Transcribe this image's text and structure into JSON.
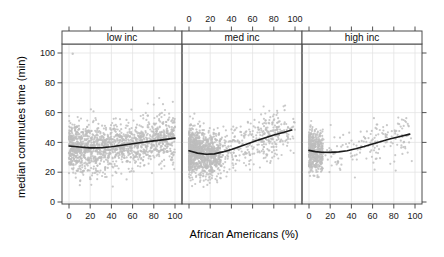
{
  "figure": {
    "width": 444,
    "height": 257,
    "background": "#ffffff"
  },
  "colors": {
    "point": "#bdbdbd",
    "smooth_line": "#1c1c1c",
    "grid": "#e3e3e3",
    "panel_border": "#4d4d4d",
    "strip_bg": "#ffffff",
    "tick": "#404040",
    "text": "#000000"
  },
  "axes": {
    "x_label": "African Americans (%)",
    "y_label": "median commutes time (min)",
    "x_ticks": [
      0,
      20,
      40,
      60,
      80,
      100
    ],
    "x_tick_labels": [
      "0",
      "20",
      "40",
      "60",
      "80",
      "100"
    ],
    "y_ticks": [
      0,
      20,
      40,
      60,
      80,
      100
    ],
    "y_tick_labels": [
      "0",
      "20",
      "40",
      "60",
      "80",
      "100"
    ],
    "xlim": [
      -6.6,
      106.6
    ],
    "ylim": [
      -1.3,
      107.4
    ],
    "top_labels_panel_index": 1,
    "bottom_labels_panel_indices": [
      0,
      2
    ],
    "grid": true
  },
  "chart_data": {
    "type": "scatter",
    "title": "",
    "xlabel": "African Americans (%)",
    "ylabel": "median commutes time (min)",
    "layout": {
      "rows": 1,
      "cols": 3
    },
    "panels": [
      {
        "label": "low inc",
        "smooth": [
          [
            0,
            37.6
          ],
          [
            10,
            36.9
          ],
          [
            20,
            36.3
          ],
          [
            30,
            36.4
          ],
          [
            40,
            37.1
          ],
          [
            50,
            38.1
          ],
          [
            60,
            39.1
          ],
          [
            70,
            40.1
          ],
          [
            80,
            41.0
          ],
          [
            90,
            41.9
          ],
          [
            100,
            42.9
          ]
        ],
        "points_model": {
          "seed": 11,
          "n": 1450,
          "y_sd": 8.2,
          "y_clip": [
            4,
            77
          ],
          "clusters": [
            {
              "w": 1.0,
              "x_min": 0,
              "x_max": 100,
              "x_pow": 1.3
            }
          ],
          "outliers": [
            [
              3.5,
              99.5
            ]
          ]
        }
      },
      {
        "label": "med inc",
        "smooth": [
          [
            0,
            34.4
          ],
          [
            8,
            32.8
          ],
          [
            16,
            32.0
          ],
          [
            24,
            32.3
          ],
          [
            32,
            33.6
          ],
          [
            40,
            35.3
          ],
          [
            48,
            37.2
          ],
          [
            56,
            39.2
          ],
          [
            64,
            41.2
          ],
          [
            72,
            43.1
          ],
          [
            80,
            44.9
          ],
          [
            88,
            46.5
          ],
          [
            97,
            48.3
          ]
        ],
        "points_model": {
          "seed": 22,
          "n": 1380,
          "y_sd": 7.8,
          "y_clip": [
            7,
            67
          ],
          "clusters": [
            {
              "w": 0.62,
              "x_min": 0,
              "x_max": 30,
              "x_pow": 1.7
            },
            {
              "w": 0.3,
              "x_min": 5,
              "x_max": 85,
              "x_pow": 1.2
            },
            {
              "w": 0.08,
              "x_min": 70,
              "x_max": 100,
              "x_pow": 1.0
            }
          ],
          "outliers": []
        }
      },
      {
        "label": "high inc",
        "smooth": [
          [
            0,
            34.6
          ],
          [
            6,
            33.8
          ],
          [
            12,
            33.4
          ],
          [
            20,
            33.3
          ],
          [
            28,
            33.6
          ],
          [
            36,
            34.4
          ],
          [
            44,
            35.7
          ],
          [
            52,
            37.2
          ],
          [
            60,
            38.9
          ],
          [
            68,
            40.6
          ],
          [
            76,
            42.2
          ],
          [
            84,
            43.7
          ],
          [
            95,
            45.6
          ]
        ],
        "points_model": {
          "seed": 33,
          "n": 640,
          "y_sd": 7.0,
          "y_clip": [
            11,
            58
          ],
          "clusters": [
            {
              "w": 0.7,
              "x_min": 0,
              "x_max": 13,
              "x_pow": 1.5
            },
            {
              "w": 0.17,
              "x_min": 5,
              "x_max": 65,
              "x_pow": 1.4
            },
            {
              "w": 0.13,
              "x_min": 55,
              "x_max": 97,
              "x_pow": 0.75
            }
          ],
          "outliers": []
        }
      }
    ]
  }
}
